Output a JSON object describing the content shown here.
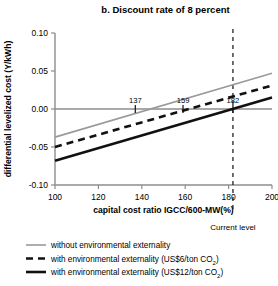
{
  "chart_data": {
    "type": "line",
    "title": "b. Discount rate of 8 percent",
    "xlabel": "capital cost ratio IGCC/600-MW(%)",
    "ylabel": "differential levelized cost (Y/kWh)",
    "xlim": [
      100,
      200
    ],
    "ylim": [
      -0.1,
      0.1
    ],
    "xticks": [
      "100",
      "120",
      "140",
      "160",
      "180",
      "200"
    ],
    "xtick_values": [
      100,
      120,
      140,
      160,
      180,
      200
    ],
    "yticks": [
      "0.10",
      "0.05",
      "0.00",
      "-0.05",
      "-0.10"
    ],
    "ytick_values": [
      0.1,
      0.05,
      0.0,
      -0.05,
      -0.1
    ],
    "grid": false,
    "zero_line": 0.0,
    "legend_position": "below",
    "series": [
      {
        "name": "without environmental externality",
        "style": "solid",
        "color": "#9a9a9a",
        "width": 1.6,
        "x": [
          100,
          200
        ],
        "y": [
          -0.037,
          0.047
        ],
        "zero_crossing": 137,
        "crossing_label": "137"
      },
      {
        "name": "with environmental externality (US$6/ton CO2)",
        "style": "dashed",
        "color": "#111111",
        "width": 2.6,
        "x": [
          100,
          200
        ],
        "y": [
          -0.05,
          0.031
        ],
        "zero_crossing": 159,
        "crossing_label": "159"
      },
      {
        "name": "with environmental externality (US$12/ton CO2)",
        "style": "solid",
        "color": "#111111",
        "width": 2.6,
        "x": [
          100,
          200
        ],
        "y": [
          -0.068,
          0.015
        ],
        "zero_crossing": 182,
        "crossing_label": "182"
      }
    ],
    "annotations": [
      {
        "name": "current-level",
        "text": "Current level",
        "x": 182,
        "style": "vertical-dashed"
      }
    ]
  },
  "legend": {
    "items": [
      {
        "label": "without environmental externality",
        "swatch": "gray-solid-line-icon"
      },
      {
        "label": "with environmental externality (US$6/ton CO",
        "sub": "2",
        "tail": ")",
        "swatch": "black-dashed-line-icon"
      },
      {
        "label": "with environmental externality (US$12/ton CO",
        "sub": "2",
        "tail": ")",
        "swatch": "black-solid-line-icon"
      }
    ]
  },
  "colors": {
    "series_gray": "#9a9a9a",
    "series_black": "#111111",
    "axis": "#8d8d8d",
    "text": "#000000"
  }
}
